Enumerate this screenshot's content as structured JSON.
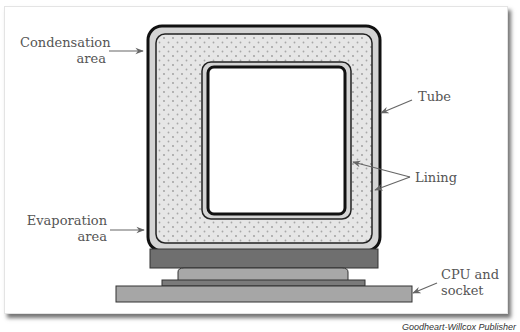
{
  "figure": {
    "labels": {
      "condensation": [
        "Condensation",
        "area"
      ],
      "evaporation": [
        "Evaporation",
        "area"
      ],
      "tube": "Tube",
      "lining": "Lining",
      "cpu": [
        "CPU and",
        "socket"
      ]
    },
    "credit": "Goodheart-Willcox Publisher",
    "colors": {
      "tube_fill": "#d4d4d4",
      "lining_fill": "#e6e6e6",
      "dot": "#9a9a9a",
      "outline": "#111111",
      "heat_plate": "#6f6f6f",
      "cpu_die": "#a8a8a8",
      "socket": "#a6a6a6",
      "label_text": "#555555",
      "arrow": "#666666"
    }
  }
}
